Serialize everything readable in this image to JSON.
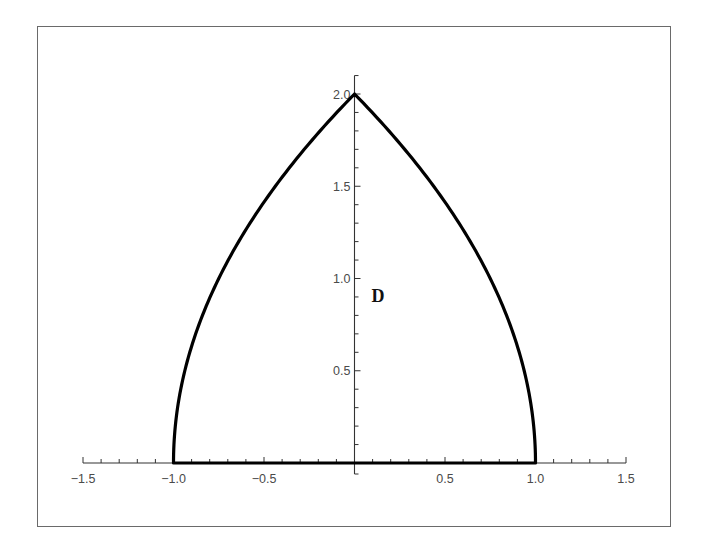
{
  "chart_data": {
    "type": "line",
    "title": "",
    "xlabel": "",
    "ylabel": "",
    "xlim": [
      -1.5,
      1.5
    ],
    "ylim": [
      0,
      2.0
    ],
    "grid": false,
    "legend": null,
    "x_ticks": [
      -1.5,
      -1.0,
      -0.5,
      0.5,
      1.0,
      1.5
    ],
    "x_tick_labels": [
      "−1.5",
      "−1.0",
      "−0.5",
      "0.5",
      "1.0",
      "1.5"
    ],
    "y_ticks": [
      0.5,
      1.0,
      1.5,
      2.0
    ],
    "y_tick_labels": [
      "0.5",
      "1.0",
      "1.5",
      "2.0"
    ],
    "minor_tick_step": 0.1,
    "series": [
      {
        "name": "left boundary",
        "equation": "x = y^2/4 - 1",
        "points": [
          [
            -1.0,
            0.0
          ],
          [
            -0.9775,
            0.3
          ],
          [
            -0.91,
            0.6
          ],
          [
            -0.798,
            0.9
          ],
          [
            -0.75,
            1.0
          ],
          [
            -0.64,
            1.2
          ],
          [
            -0.51,
            1.4
          ],
          [
            -0.36,
            1.6
          ],
          [
            -0.19,
            1.8
          ],
          [
            0.0,
            2.0
          ]
        ]
      },
      {
        "name": "right boundary",
        "equation": "x = 1 - y^2/4",
        "points": [
          [
            0.0,
            2.0
          ],
          [
            0.19,
            1.8
          ],
          [
            0.36,
            1.6
          ],
          [
            0.51,
            1.4
          ],
          [
            0.64,
            1.2
          ],
          [
            0.75,
            1.0
          ],
          [
            0.798,
            0.9
          ],
          [
            0.91,
            0.6
          ],
          [
            0.9775,
            0.3
          ],
          [
            1.0,
            0.0
          ]
        ]
      },
      {
        "name": "bottom boundary",
        "equation": "y = 0, -1 <= x <= 1",
        "points": [
          [
            -1.0,
            0.0
          ],
          [
            1.0,
            0.0
          ]
        ]
      }
    ],
    "annotations": [
      {
        "text": "D",
        "x": 0.1,
        "y": 0.9
      }
    ]
  },
  "labels": {
    "region": "D"
  }
}
